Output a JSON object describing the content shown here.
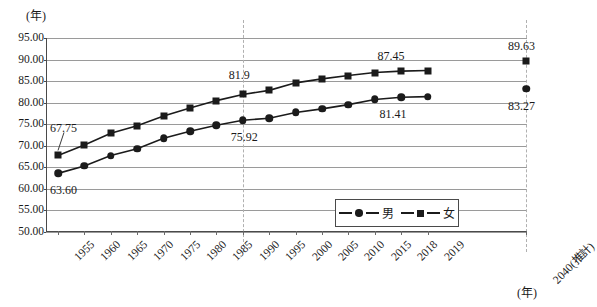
{
  "chart_data": {
    "type": "line",
    "title": "",
    "xlabel": "(年)",
    "ylabel": "(年)",
    "ylim": [
      50.0,
      95.0
    ],
    "ytick_step": 5.0,
    "grid": true,
    "legend_position": "bottom-right",
    "ytick_labels": [
      "95.00",
      "90.00",
      "85.00",
      "80.00",
      "75.00",
      "70.00",
      "65.00",
      "60.00",
      "55.00",
      "50.00"
    ],
    "ytick_values": [
      95.0,
      90.0,
      85.0,
      80.0,
      75.0,
      70.0,
      65.0,
      60.0,
      55.0,
      50.0
    ],
    "categories": [
      "1955",
      "1960",
      "1965",
      "1970",
      "1975",
      "1980",
      "1985",
      "1990",
      "1995",
      "2000",
      "2005",
      "2010",
      "2015",
      "2018",
      "2019",
      "2040(推計)"
    ],
    "dashed_gridline_categories": [
      "1990",
      "2040(推計)"
    ],
    "series": [
      {
        "name": "男",
        "marker": "circle",
        "values": [
          63.6,
          65.32,
          67.74,
          69.31,
          71.73,
          73.35,
          74.78,
          75.92,
          76.38,
          77.72,
          78.56,
          79.55,
          80.75,
          81.25,
          81.41,
          83.27
        ],
        "disconnected_last_point": true
      },
      {
        "name": "女",
        "marker": "square",
        "values": [
          67.75,
          70.19,
          72.92,
          74.66,
          76.89,
          78.76,
          80.48,
          81.9,
          82.85,
          84.6,
          85.52,
          86.3,
          86.99,
          87.32,
          87.45,
          89.63
        ],
        "disconnected_last_point": true
      }
    ],
    "annotations": [
      {
        "label": "67.75",
        "category": "1955",
        "series": "女",
        "value": 67.75
      },
      {
        "label": "63.60",
        "category": "1955",
        "series": "男",
        "value": 63.6
      },
      {
        "label": "81.9",
        "category": "1990",
        "series": "女",
        "value": 81.9
      },
      {
        "label": "75.92",
        "category": "1990",
        "series": "男",
        "value": 75.92
      },
      {
        "label": "87.45",
        "category": "2019",
        "series": "女",
        "value": 87.45
      },
      {
        "label": "81.41",
        "category": "2019",
        "series": "男",
        "value": 81.41
      },
      {
        "label": "89.63",
        "category": "2040(推計)",
        "series": "女",
        "value": 89.63
      },
      {
        "label": "83.27",
        "category": "2040(推計)",
        "series": "男",
        "value": 83.27
      }
    ]
  },
  "legend": {
    "male_label": "男",
    "female_label": "女"
  },
  "axes": {
    "y_unit": "(年)",
    "x_unit": "(年)"
  },
  "colors": {
    "marker": "#1b1b1b",
    "line": "#1b1b1b",
    "grid": "#9a9a9a",
    "axis": "#4a4a4a",
    "dashed": "#b0b0b0",
    "background": "#ffffff"
  }
}
